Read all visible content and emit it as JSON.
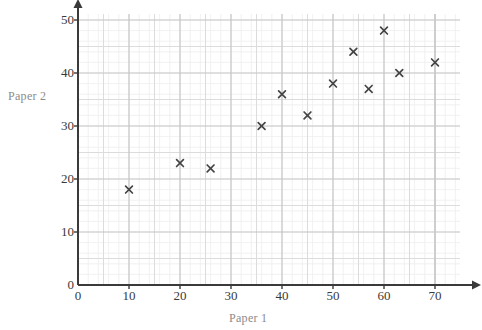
{
  "chart_data": {
    "type": "scatter",
    "title": "",
    "xlabel": "Paper 1",
    "ylabel": "Paper 2",
    "xlim": [
      0,
      75
    ],
    "ylim": [
      0,
      52
    ],
    "xticks": [
      0,
      10,
      20,
      30,
      40,
      50,
      60,
      70
    ],
    "xtick_labels": [
      "0",
      "10",
      "20",
      "30",
      "40",
      "50",
      "60",
      "70"
    ],
    "yticks": [
      0,
      10,
      20,
      30,
      40,
      50
    ],
    "ytick_labels": [
      "0",
      "10",
      "20",
      "30",
      "40",
      "50"
    ],
    "grid": true,
    "grid_major_step_x": 10,
    "grid_major_step_y": 10,
    "grid_minor_step": 2,
    "legend": null,
    "marker": "x",
    "marker_color": "#444444",
    "points": [
      {
        "x": 10,
        "y": 18
      },
      {
        "x": 20,
        "y": 23
      },
      {
        "x": 26,
        "y": 22
      },
      {
        "x": 36,
        "y": 30
      },
      {
        "x": 40,
        "y": 36
      },
      {
        "x": 45,
        "y": 32
      },
      {
        "x": 50,
        "y": 38
      },
      {
        "x": 54,
        "y": 44
      },
      {
        "x": 57,
        "y": 37
      },
      {
        "x": 60,
        "y": 48
      },
      {
        "x": 63,
        "y": 40
      },
      {
        "x": 70,
        "y": 42
      }
    ]
  },
  "colors": {
    "axis": "#3a3a3a",
    "grid_major": "#c6c6c6",
    "grid_medium": "#dcdcdc",
    "grid_minor": "#ededed",
    "marker": "#444444",
    "label": "#8b8b8b",
    "tick": "#3a3a3a",
    "background": "#ffffff"
  },
  "labels": {
    "y_axis_title": "Paper 2",
    "x_axis_title": "Paper 1"
  },
  "artifacts": {
    "top_cut_text": "",
    "bottom_cut_text": ""
  }
}
